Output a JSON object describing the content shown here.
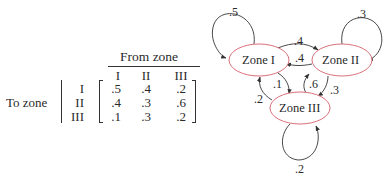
{
  "matrix": {
    "column_group_label": "From zone",
    "row_group_label": "To zone",
    "column_headers": [
      "I",
      "II",
      "III"
    ],
    "row_headers": [
      "I",
      "II",
      "III"
    ],
    "rows": [
      [
        ".5",
        ".4",
        ".2"
      ],
      [
        ".4",
        ".3",
        ".6"
      ],
      [
        ".1",
        ".3",
        ".2"
      ]
    ]
  },
  "diagram": {
    "nodes": [
      {
        "id": "zone1",
        "label": "Zone I"
      },
      {
        "id": "zone2",
        "label": "Zone II"
      },
      {
        "id": "zone3",
        "label": "Zone III"
      }
    ],
    "edges": [
      {
        "from": "Zone I",
        "to": "Zone I",
        "label": ".5"
      },
      {
        "from": "Zone I",
        "to": "Zone II",
        "label": ".4"
      },
      {
        "from": "Zone II",
        "to": "Zone I",
        "label": ".4"
      },
      {
        "from": "Zone II",
        "to": "Zone II",
        "label": ".3"
      },
      {
        "from": "Zone I",
        "to": "Zone III",
        "label": ".1"
      },
      {
        "from": "Zone III",
        "to": "Zone I",
        "label": ".2"
      },
      {
        "from": "Zone III",
        "to": "Zone II",
        "label": ".6"
      },
      {
        "from": "Zone II",
        "to": "Zone III",
        "label": ".3"
      },
      {
        "from": "Zone III",
        "to": "Zone III",
        "label": ".2"
      }
    ],
    "colors": {
      "node_stroke": "#d9707a",
      "edge_stroke": "#333333",
      "text": "#2a2a2a"
    }
  }
}
